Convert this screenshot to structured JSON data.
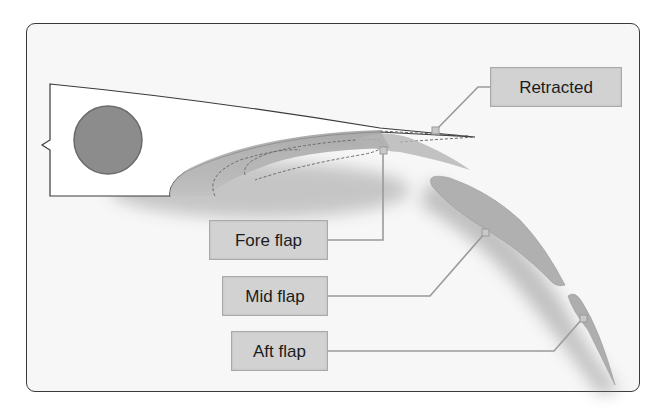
{
  "diagram": {
    "type": "wing-flap-cross-section",
    "labels": {
      "retracted": "Retracted",
      "fore_flap": "Fore flap",
      "mid_flap": "Mid flap",
      "aft_flap": "Aft flap"
    },
    "colors": {
      "frame_border": "#3a3a3a",
      "frame_fill": "#f7f7f7",
      "label_fill": "#d2d2d2",
      "label_border": "#a9a9a9",
      "leader_line": "#9a9a9a",
      "spar_circle": "#8c8c8c",
      "flap_fill": "#a8a8a8"
    }
  }
}
